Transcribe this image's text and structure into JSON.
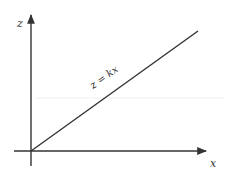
{
  "diagram": {
    "type": "coordinate-axes-with-line",
    "axes": {
      "vertical": {
        "label": "z"
      },
      "horizontal": {
        "label": "x"
      }
    },
    "line": {
      "equation": "z = kx"
    },
    "colors": {
      "stroke": "#333333",
      "text": "#333333",
      "faint_line": "#f0f0f0",
      "background": "#ffffff"
    }
  }
}
